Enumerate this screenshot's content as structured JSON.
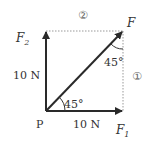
{
  "diagram": {
    "type": "force-vector-decomposition",
    "origin_label": "P",
    "resultant": {
      "label": "F",
      "angle_from_f1": "45°",
      "angle_from_dotted_vertical": "45°"
    },
    "components": [
      {
        "label_main": "F",
        "label_sub": "1",
        "magnitude": "10 N",
        "direction": "right"
      },
      {
        "label_main": "F",
        "label_sub": "2",
        "magnitude": "10 N",
        "direction": "up"
      }
    ],
    "dotted_lines": [
      {
        "marker": "②",
        "position": "top"
      },
      {
        "marker": "①",
        "position": "right"
      }
    ],
    "colors": {
      "vector": "#2a2a2a",
      "dotted": "#999999",
      "text": "#333333"
    }
  }
}
